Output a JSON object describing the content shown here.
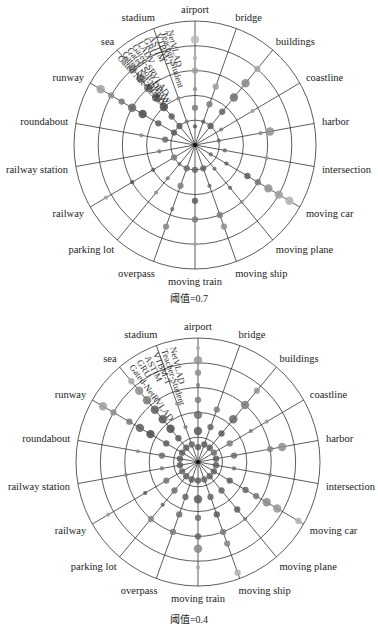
{
  "chart_data": [
    {
      "type": "scatter",
      "subtype": "polar-bubble",
      "title": "",
      "caption": "阈值=0.7",
      "threshold": 0.7,
      "categories": [
        "airport",
        "bridge",
        "buildings",
        "coastline",
        "harbor",
        "intersection",
        "moving car",
        "moving plane",
        "moving ship",
        "moving train",
        "overpass",
        "parking lot",
        "railway",
        "railway station",
        "roundabout",
        "runway",
        "sea",
        "stadium"
      ],
      "methods": [
        "NetVLAD",
        "Teacher-Student",
        "VTBM-T",
        "ASTIM",
        "GRU",
        "LADV",
        "Gated-SRVLAD",
        "Gated Soft-DBoW",
        "Gated Net-DBoW",
        "Gated Net-VLAD"
      ],
      "rings": 5,
      "grid": true,
      "legend": "radial method labels along stadium–airport sector",
      "center": [
        195,
        145
      ],
      "radius": [
        121,
        124
      ],
      "series_note": "Each spoke shows dots at ring positions 1..10 (method index); dot size/darkness encode score",
      "points": [
        {
          "cat": "airport",
          "r": [
            0.15,
            0.3,
            0.45,
            0.6,
            0.7,
            0.85
          ],
          "s": [
            2,
            3,
            2,
            3,
            2,
            4
          ],
          "g": [
            0.3,
            0.5,
            0.6,
            0.7,
            0.8,
            0.85
          ]
        },
        {
          "cat": "bridge",
          "r": [
            0.2,
            0.35,
            0.5
          ],
          "s": [
            2,
            3,
            3
          ],
          "g": [
            0.35,
            0.5,
            0.7
          ]
        },
        {
          "cat": "buildings",
          "r": [
            0.2,
            0.35,
            0.5,
            0.65,
            0.8
          ],
          "s": [
            3,
            3,
            4,
            4,
            3
          ],
          "g": [
            0.3,
            0.35,
            0.4,
            0.55,
            0.75
          ]
        },
        {
          "cat": "coastline",
          "r": [
            0.25,
            0.55
          ],
          "s": [
            2,
            2
          ],
          "g": [
            0.5,
            0.7
          ]
        },
        {
          "cat": "harbor",
          "r": [
            0.2,
            0.55,
            0.63
          ],
          "s": [
            2,
            2,
            4
          ],
          "g": [
            0.4,
            0.6,
            0.6
          ]
        },
        {
          "cat": "intersection",
          "r": [
            0.25,
            0.6
          ],
          "s": [
            2,
            2
          ],
          "g": [
            0.4,
            0.7
          ]
        },
        {
          "cat": "moving car",
          "r": [
            0.15,
            0.3,
            0.5,
            0.6,
            0.7,
            0.8,
            0.9
          ],
          "s": [
            2,
            2,
            3,
            3,
            4,
            4,
            4
          ],
          "g": [
            0.4,
            0.3,
            0.3,
            0.45,
            0.6,
            0.7,
            0.8
          ]
        },
        {
          "cat": "moving plane",
          "r": [
            0.25,
            0.45,
            0.6
          ],
          "s": [
            2,
            2,
            2
          ],
          "g": [
            0.4,
            0.35,
            0.6
          ]
        },
        {
          "cat": "moving ship",
          "r": [
            0.2,
            0.35,
            0.6,
            0.7
          ],
          "s": [
            3,
            2,
            3,
            3
          ],
          "g": [
            0.35,
            0.4,
            0.5,
            0.6
          ]
        },
        {
          "cat": "moving train",
          "r": [
            0.2,
            0.45,
            0.6,
            0.8
          ],
          "s": [
            3,
            3,
            3,
            2
          ],
          "g": [
            0.35,
            0.3,
            0.5,
            0.75
          ]
        },
        {
          "cat": "overpass",
          "r": [
            0.2,
            0.35,
            0.55,
            0.7
          ],
          "s": [
            3,
            3,
            2,
            3
          ],
          "g": [
            0.4,
            0.5,
            0.4,
            0.55
          ]
        },
        {
          "cat": "parking lot",
          "r": [
            0.2,
            0.35,
            0.5
          ],
          "s": [
            2,
            2,
            2
          ],
          "g": [
            0.4,
            0.5,
            0.6
          ]
        },
        {
          "cat": "railway",
          "r": [
            0.2,
            0.4,
            0.6,
            0.85
          ],
          "s": [
            3,
            2,
            2,
            2
          ],
          "g": [
            0.5,
            0.3,
            0.25,
            0.7
          ]
        },
        {
          "cat": "railway station",
          "r": [
            0.3
          ],
          "s": [
            2
          ],
          "g": [
            0.5
          ]
        },
        {
          "cat": "roundabout",
          "r": [
            0.25,
            0.45
          ],
          "s": [
            3,
            2
          ],
          "g": [
            0.4,
            0.6
          ]
        },
        {
          "cat": "runway",
          "r": [
            0.2,
            0.35,
            0.5,
            0.6,
            0.7,
            0.8,
            0.9
          ],
          "s": [
            3,
            3,
            4,
            4,
            3,
            3,
            4
          ],
          "g": [
            0.3,
            0.3,
            0.2,
            0.35,
            0.45,
            0.6,
            0.7
          ]
        },
        {
          "cat": "sea",
          "r": [
            0.2,
            0.3,
            0.4,
            0.5,
            0.6,
            0.7,
            0.8,
            0.9
          ],
          "s": [
            3,
            3,
            4,
            4,
            4,
            4,
            4,
            3
          ],
          "g": [
            0.3,
            0.3,
            0.2,
            0.25,
            0.35,
            0.45,
            0.6,
            0.75
          ]
        },
        {
          "cat": "stadium",
          "r": [
            0.2,
            0.4
          ],
          "s": [
            2,
            2
          ],
          "g": [
            0.5,
            0.6
          ]
        }
      ]
    },
    {
      "type": "scatter",
      "subtype": "polar-bubble",
      "title": "",
      "caption": "阈值=0.4",
      "threshold": 0.4,
      "categories": [
        "airport",
        "bridge",
        "buildings",
        "coastline",
        "harbor",
        "intersection",
        "moving car",
        "moving plane",
        "moving ship",
        "moving train",
        "overpass",
        "parking lot",
        "railway",
        "railway station",
        "roundabout",
        "runway",
        "sea",
        "stadium"
      ],
      "methods": [
        "NetVLAD",
        "Teacher-Student",
        "VTBM-T",
        "ASTIM",
        "GRU",
        "Gated-NetRVLAD"
      ],
      "rings": 5,
      "grid": true,
      "legend": "radial method labels along stadium–airport sector",
      "center": [
        198,
        462
      ],
      "radius": [
        122,
        124
      ],
      "points": [
        {
          "cat": "airport",
          "r": [
            0.12,
            0.25,
            0.38,
            0.5,
            0.62,
            0.72,
            0.82,
            0.92
          ],
          "s": [
            3,
            4,
            4,
            3,
            2,
            3,
            4,
            2
          ],
          "g": [
            0.3,
            0.3,
            0.4,
            0.5,
            0.5,
            0.6,
            0.65,
            0.8
          ]
        },
        {
          "cat": "bridge",
          "r": [
            0.15,
            0.3,
            0.45
          ],
          "s": [
            3,
            3,
            3
          ],
          "g": [
            0.3,
            0.35,
            0.5
          ]
        },
        {
          "cat": "buildings",
          "r": [
            0.15,
            0.3,
            0.45,
            0.6,
            0.75
          ],
          "s": [
            3,
            3,
            4,
            4,
            3
          ],
          "g": [
            0.3,
            0.3,
            0.35,
            0.5,
            0.65
          ]
        },
        {
          "cat": "coastline",
          "r": [
            0.15,
            0.3,
            0.5,
            0.65
          ],
          "s": [
            3,
            3,
            2,
            2
          ],
          "g": [
            0.4,
            0.5,
            0.5,
            0.65
          ]
        },
        {
          "cat": "harbor",
          "r": [
            0.15,
            0.3,
            0.6,
            0.7
          ],
          "s": [
            3,
            3,
            3,
            4
          ],
          "g": [
            0.3,
            0.4,
            0.55,
            0.6
          ]
        },
        {
          "cat": "intersection",
          "r": [
            0.15,
            0.3,
            0.6
          ],
          "s": [
            3,
            2,
            2
          ],
          "g": [
            0.3,
            0.4,
            0.6
          ]
        },
        {
          "cat": "moving car",
          "r": [
            0.15,
            0.3,
            0.45,
            0.55,
            0.65,
            0.75,
            0.95
          ],
          "s": [
            3,
            3,
            3,
            3,
            4,
            4,
            3
          ],
          "g": [
            0.3,
            0.3,
            0.35,
            0.45,
            0.55,
            0.65,
            0.8
          ]
        },
        {
          "cat": "moving plane",
          "r": [
            0.15,
            0.3,
            0.5,
            0.6
          ],
          "s": [
            3,
            3,
            3,
            2
          ],
          "g": [
            0.3,
            0.35,
            0.3,
            0.5
          ]
        },
        {
          "cat": "moving ship",
          "r": [
            0.15,
            0.3,
            0.45,
            0.6,
            0.7,
            0.95
          ],
          "s": [
            3,
            3,
            3,
            3,
            3,
            3
          ],
          "g": [
            0.35,
            0.35,
            0.3,
            0.5,
            0.55,
            0.8
          ]
        },
        {
          "cat": "moving train",
          "r": [
            0.15,
            0.3,
            0.45,
            0.6,
            0.7,
            0.85
          ],
          "s": [
            3,
            4,
            3,
            3,
            4,
            2
          ],
          "g": [
            0.3,
            0.3,
            0.4,
            0.35,
            0.55,
            0.75
          ]
        },
        {
          "cat": "overpass",
          "r": [
            0.15,
            0.3,
            0.45,
            0.6
          ],
          "s": [
            3,
            3,
            3,
            3
          ],
          "g": [
            0.3,
            0.35,
            0.4,
            0.5
          ]
        },
        {
          "cat": "parking lot",
          "r": [
            0.15,
            0.3,
            0.45,
            0.6
          ],
          "s": [
            3,
            3,
            2,
            3
          ],
          "g": [
            0.3,
            0.4,
            0.35,
            0.55
          ]
        },
        {
          "cat": "railway",
          "r": [
            0.15,
            0.3,
            0.5,
            0.85
          ],
          "s": [
            3,
            3,
            2,
            2
          ],
          "g": [
            0.35,
            0.45,
            0.25,
            0.7
          ]
        },
        {
          "cat": "railway station",
          "r": [
            0.15,
            0.3,
            0.6
          ],
          "s": [
            3,
            2,
            2
          ],
          "g": [
            0.3,
            0.45,
            0.6
          ]
        },
        {
          "cat": "roundabout",
          "r": [
            0.15,
            0.3,
            0.5
          ],
          "s": [
            3,
            3,
            2
          ],
          "g": [
            0.3,
            0.4,
            0.6
          ]
        },
        {
          "cat": "runway",
          "r": [
            0.15,
            0.3,
            0.45,
            0.55,
            0.65,
            0.8,
            0.9
          ],
          "s": [
            3,
            3,
            4,
            4,
            3,
            3,
            4
          ],
          "g": [
            0.3,
            0.3,
            0.2,
            0.3,
            0.45,
            0.6,
            0.7
          ]
        },
        {
          "cat": "sea",
          "r": [
            0.15,
            0.25,
            0.35,
            0.45,
            0.55,
            0.65,
            0.75,
            0.85
          ],
          "s": [
            3,
            3,
            4,
            4,
            4,
            4,
            4,
            3
          ],
          "g": [
            0.3,
            0.3,
            0.2,
            0.25,
            0.3,
            0.45,
            0.6,
            0.75
          ]
        },
        {
          "cat": "stadium",
          "r": [
            0.15,
            0.3,
            0.5
          ],
          "s": [
            3,
            2,
            2
          ],
          "g": [
            0.35,
            0.5,
            0.6
          ]
        }
      ]
    }
  ],
  "captions": {
    "chart1": "阈值=0.7",
    "chart2": "阈值=0.4"
  },
  "colors": {
    "grid": "#333333",
    "text": "#222222",
    "dot_dark": "#3a3a3a",
    "dot_light": "#c8c8c8"
  }
}
